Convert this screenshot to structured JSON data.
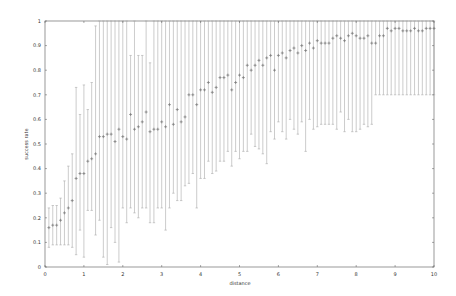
{
  "chart_data": {
    "type": "scatter",
    "title": "",
    "xlabel": "distance",
    "ylabel": "success rate",
    "xlim": [
      0,
      10
    ],
    "ylim": [
      0,
      1
    ],
    "xticks": [
      "0",
      "1",
      "2",
      "3",
      "4",
      "5",
      "6",
      "7",
      "8",
      "9",
      "10"
    ],
    "yticks": [
      "0",
      "0.1",
      "0.2",
      "0.3",
      "0.4",
      "0.5",
      "0.6",
      "0.7",
      "0.8",
      "0.9",
      "1"
    ],
    "grid": false,
    "legend": null,
    "marker": "+",
    "error_bars": true,
    "colors": {
      "points": "#777777",
      "errorbars": "#aaaaaa",
      "axes": "#555555"
    },
    "x": [
      0.1,
      0.2,
      0.3,
      0.4,
      0.5,
      0.6,
      0.7,
      0.8,
      0.9,
      1.0,
      1.1,
      1.2,
      1.3,
      1.4,
      1.5,
      1.6,
      1.7,
      1.8,
      1.9,
      2.0,
      2.1,
      2.2,
      2.3,
      2.4,
      2.5,
      2.6,
      2.7,
      2.8,
      2.9,
      3.0,
      3.1,
      3.2,
      3.3,
      3.4,
      3.5,
      3.6,
      3.7,
      3.8,
      3.9,
      4.0,
      4.1,
      4.2,
      4.3,
      4.4,
      4.5,
      4.6,
      4.7,
      4.8,
      4.9,
      5.0,
      5.1,
      5.2,
      5.3,
      5.4,
      5.5,
      5.6,
      5.7,
      5.8,
      5.9,
      6.0,
      6.1,
      6.2,
      6.3,
      6.4,
      6.5,
      6.6,
      6.7,
      6.8,
      6.9,
      7.0,
      7.1,
      7.2,
      7.3,
      7.4,
      7.5,
      7.6,
      7.7,
      7.8,
      7.9,
      8.0,
      8.1,
      8.2,
      8.3,
      8.4,
      8.5,
      8.6,
      8.7,
      8.8,
      8.9,
      9.0,
      9.1,
      9.2,
      9.3,
      9.4,
      9.5,
      9.6,
      9.7,
      9.8,
      9.9,
      10.0
    ],
    "y": [
      0.16,
      0.17,
      0.17,
      0.19,
      0.22,
      0.24,
      0.27,
      0.36,
      0.38,
      0.38,
      0.43,
      0.44,
      0.46,
      0.53,
      0.53,
      0.54,
      0.54,
      0.51,
      0.56,
      0.53,
      0.52,
      0.62,
      0.56,
      0.57,
      0.59,
      0.63,
      0.55,
      0.56,
      0.56,
      0.59,
      0.57,
      0.66,
      0.58,
      0.64,
      0.59,
      0.61,
      0.7,
      0.7,
      0.66,
      0.72,
      0.72,
      0.75,
      0.71,
      0.73,
      0.77,
      0.77,
      0.78,
      0.72,
      0.75,
      0.78,
      0.77,
      0.82,
      0.8,
      0.82,
      0.84,
      0.82,
      0.85,
      0.86,
      0.8,
      0.86,
      0.87,
      0.85,
      0.88,
      0.89,
      0.87,
      0.9,
      0.88,
      0.91,
      0.89,
      0.92,
      0.91,
      0.91,
      0.91,
      0.93,
      0.94,
      0.93,
      0.92,
      0.94,
      0.95,
      0.94,
      0.93,
      0.93,
      0.94,
      0.91,
      0.91,
      0.94,
      0.94,
      0.97,
      0.96,
      0.97,
      0.97,
      0.96,
      0.96,
      0.96,
      0.97,
      0.96,
      0.96,
      0.97,
      0.97,
      0.97
    ],
    "yerr_low": [
      0.08,
      0.09,
      0.09,
      0.09,
      0.09,
      0.09,
      0.08,
      0.05,
      0.15,
      0.04,
      0.23,
      0.23,
      0.13,
      0.19,
      0.04,
      0.01,
      0.16,
      0.1,
      0.02,
      0.24,
      0.18,
      0.24,
      0.22,
      0.2,
      0.24,
      0.24,
      0.18,
      0.18,
      0.24,
      0.24,
      0.15,
      0.24,
      0.3,
      0.27,
      0.27,
      0.33,
      0.34,
      0.38,
      0.24,
      0.36,
      0.36,
      0.43,
      0.38,
      0.39,
      0.43,
      0.43,
      0.47,
      0.41,
      0.47,
      0.44,
      0.47,
      0.47,
      0.54,
      0.49,
      0.48,
      0.46,
      0.42,
      0.55,
      0.52,
      0.59,
      0.55,
      0.52,
      0.6,
      0.56,
      0.54,
      0.59,
      0.47,
      0.6,
      0.56,
      0.57,
      0.58,
      0.58,
      0.58,
      0.58,
      0.56,
      0.63,
      0.55,
      0.6,
      0.55,
      0.55,
      0.56,
      0.58,
      0.57,
      0.58,
      0.7,
      0.7,
      0.7,
      0.7,
      0.7,
      0.7,
      0.7,
      0.7,
      0.7,
      0.7,
      0.7,
      0.7,
      0.7,
      0.7,
      0.7,
      0.7
    ],
    "yerr_high": [
      0.24,
      0.25,
      0.25,
      0.28,
      0.35,
      0.41,
      0.46,
      0.73,
      0.62,
      0.74,
      0.64,
      0.75,
      0.98,
      1.0,
      1.0,
      1.0,
      1.0,
      1.0,
      1.0,
      1.0,
      1.0,
      0.86,
      1.0,
      0.86,
      0.86,
      1.0,
      0.83,
      1.0,
      1.0,
      1.0,
      1.0,
      1.0,
      1.0,
      1.0,
      1.0,
      1.0,
      1.0,
      1.0,
      1.0,
      1.0,
      1.0,
      1.0,
      1.0,
      1.0,
      1.0,
      1.0,
      1.0,
      1.0,
      1.0,
      1.0,
      1.0,
      1.0,
      1.0,
      1.0,
      1.0,
      1.0,
      1.0,
      1.0,
      1.0,
      1.0,
      1.0,
      1.0,
      1.0,
      1.0,
      1.0,
      1.0,
      1.0,
      1.0,
      1.0,
      1.0,
      1.0,
      1.0,
      1.0,
      1.0,
      1.0,
      1.0,
      1.0,
      1.0,
      1.0,
      1.0,
      1.0,
      1.0,
      1.0,
      1.0,
      1.0,
      1.0,
      1.0,
      1.0,
      1.0,
      1.0,
      1.0,
      1.0,
      1.0,
      1.0,
      1.0,
      1.0,
      1.0,
      1.0,
      1.0,
      1.0
    ]
  }
}
